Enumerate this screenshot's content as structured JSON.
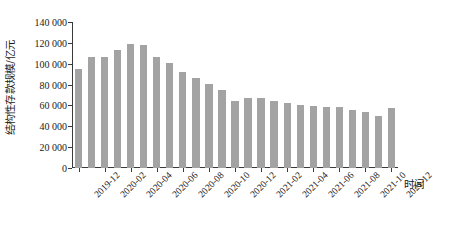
{
  "chart_data": {
    "type": "bar",
    "title": "",
    "xlabel": "时间",
    "ylabel": "结构性存款规模/亿元",
    "ylim": [
      0,
      140000
    ],
    "yticks": [
      0,
      20000,
      40000,
      60000,
      80000,
      100000,
      120000,
      140000
    ],
    "ytick_labels": [
      "0",
      "20 000",
      "40 000",
      "60 000",
      "80 000",
      "100 000",
      "120 000",
      "140 000"
    ],
    "grid": false,
    "legend": null,
    "bar_color": "#a3a3a3",
    "axis_color": "#3a3a3a",
    "categories": [
      "2019-12",
      "2020-01",
      "2020-02",
      "2020-03",
      "2020-04",
      "2020-05",
      "2020-06",
      "2020-07",
      "2020-08",
      "2020-09",
      "2020-10",
      "2020-11",
      "2020-12",
      "2021-01",
      "2021-02",
      "2021-03",
      "2021-04",
      "2021-05",
      "2021-06",
      "2021-07",
      "2021-08",
      "2021-09",
      "2021-10",
      "2021-11",
      "2021-12"
    ],
    "values": [
      95000,
      106000,
      106000,
      113500,
      119000,
      118000,
      106500,
      101000,
      92500,
      86000,
      80500,
      74500,
      64500,
      67500,
      67500,
      64000,
      62500,
      60500,
      59500,
      58500,
      58500,
      55500,
      54000,
      49500,
      58000
    ],
    "xtick_labels": [
      "2019-12",
      "2020-02",
      "2020-04",
      "2020-06",
      "2020-08",
      "2020-10",
      "2020-12",
      "2021-02",
      "2021-04",
      "2021-06",
      "2021-08",
      "2021-10",
      "2021-12"
    ],
    "xtick_indices": [
      0,
      2,
      4,
      6,
      8,
      10,
      12,
      14,
      16,
      18,
      20,
      22,
      24
    ]
  }
}
